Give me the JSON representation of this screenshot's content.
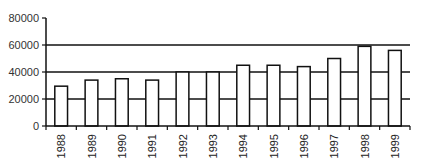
{
  "chart_data": {
    "type": "bar",
    "title": "",
    "xlabel": "",
    "ylabel": "",
    "categories": [
      "1988",
      "1989",
      "1990",
      "1991",
      "1992",
      "1993",
      "1994",
      "1995",
      "1996",
      "1997",
      "1998",
      "1999"
    ],
    "values": [
      29500,
      34000,
      35000,
      34000,
      40000,
      40000,
      45000,
      45000,
      44000,
      50000,
      59000,
      56000
    ],
    "ylim": [
      0,
      80000
    ],
    "yticks": [
      "0",
      "20000",
      "40000",
      "60000",
      "80000"
    ],
    "grid": true,
    "legend": null,
    "bar_fill": "#ffffff",
    "bar_stroke": "#111111"
  }
}
